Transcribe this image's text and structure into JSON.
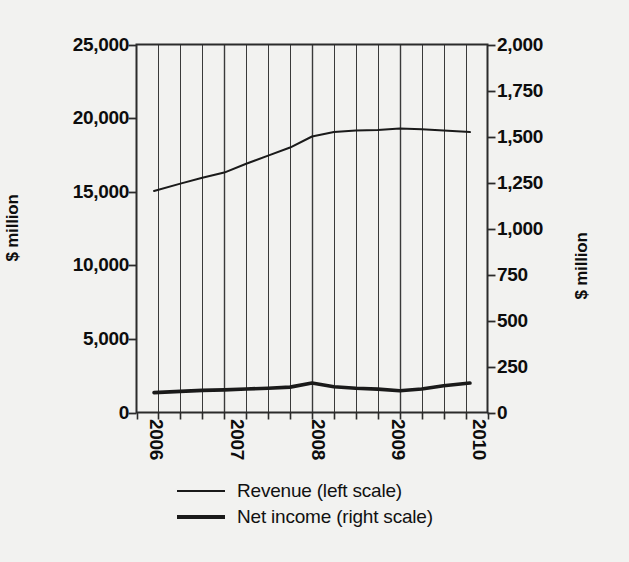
{
  "chart_data": {
    "type": "line",
    "title": "",
    "subtitle": "",
    "xlabel": "",
    "ylabel": "$ million",
    "ylabel_right": "$ million",
    "grid": true,
    "grid_orientation": "vertical",
    "legend_position": "bottom",
    "background_color": "#f2f2f0",
    "line_color": "#1a1a1a",
    "x": [
      "2006 Q1",
      "2006 Q2",
      "2006 Q3",
      "2006 Q4",
      "2007 Q1",
      "2007 Q2",
      "2007 Q3",
      "2007 Q4",
      "2008 Q1",
      "2008 Q2",
      "2008 Q3",
      "2008 Q4",
      "2009 Q1",
      "2009 Q2",
      "2009 Q3",
      "2009 Q4"
    ],
    "xlim": [
      2006.0,
      2010.0
    ],
    "x_tick_labels": [
      "2006",
      "2007",
      "2008",
      "2009",
      "2010"
    ],
    "x_tick_values": [
      2006,
      2007,
      2008,
      2009,
      2010
    ],
    "axes": [
      {
        "id": "left",
        "label": "$ million",
        "ylim": [
          0,
          25000
        ],
        "tick_labels": [
          "0",
          "5,000",
          "10,000",
          "15,000",
          "20,000",
          "25,000"
        ],
        "tick_values": [
          0,
          5000,
          10000,
          15000,
          20000,
          25000
        ]
      },
      {
        "id": "right",
        "label": "$ million",
        "ylim": [
          0,
          2000
        ],
        "tick_labels": [
          "0",
          "250",
          "500",
          "750",
          "1,000",
          "1,250",
          "1,500",
          "1,750",
          "2,000"
        ],
        "tick_values": [
          0,
          250,
          500,
          750,
          1000,
          1250,
          1500,
          1750,
          2000
        ]
      }
    ],
    "series": [
      {
        "name": "Revenue (left scale)",
        "legend_label": "Revenue (left scale)",
        "axis": "left",
        "line_width": 2,
        "x": [
          2006.2,
          2006.5,
          2006.75,
          2007.0,
          2007.25,
          2007.5,
          2007.75,
          2008.0,
          2008.25,
          2008.5,
          2008.75,
          2009.0,
          2009.25,
          2009.5,
          2009.8
        ],
        "values": [
          15050,
          15550,
          15950,
          16300,
          16900,
          17450,
          18000,
          18750,
          19050,
          19150,
          19200,
          19300,
          19250,
          19150,
          19050
        ]
      },
      {
        "name": "Net income (right scale)",
        "legend_label": "Net income (right scale)",
        "axis": "right",
        "line_width": 4,
        "x": [
          2006.2,
          2006.5,
          2006.75,
          2007.0,
          2007.25,
          2007.5,
          2007.75,
          2008.0,
          2008.25,
          2008.5,
          2008.75,
          2009.0,
          2009.25,
          2009.5,
          2009.8
        ],
        "values": [
          108,
          115,
          120,
          123,
          128,
          132,
          138,
          160,
          140,
          132,
          127,
          118,
          128,
          145,
          160
        ]
      }
    ]
  },
  "legend": {
    "items": [
      {
        "label": "Revenue (left scale)",
        "weight": "thin"
      },
      {
        "label": "Net income (right scale)",
        "weight": "thick"
      }
    ]
  }
}
